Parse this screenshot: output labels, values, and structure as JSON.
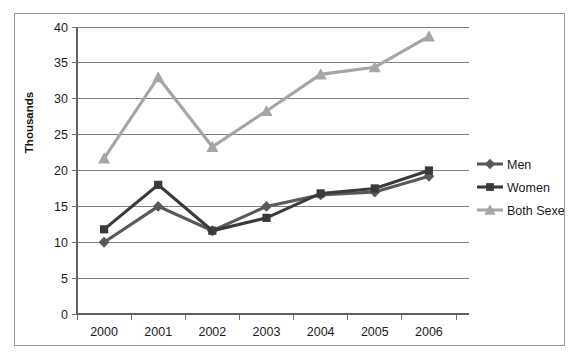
{
  "chart_data": {
    "type": "line",
    "title": "",
    "xlabel": "",
    "ylabel": "Thousands",
    "categories": [
      "2000",
      "2001",
      "2002",
      "2003",
      "2004",
      "2005",
      "2006"
    ],
    "x": [
      2000,
      2001,
      2002,
      2003,
      2004,
      2005,
      2006
    ],
    "ylim": [
      0,
      40
    ],
    "yticks": [
      0,
      5,
      10,
      15,
      20,
      25,
      30,
      35,
      40
    ],
    "ytick_labels": [
      "0",
      "5",
      "10",
      "15",
      "20",
      "25",
      "30",
      "35",
      "40"
    ],
    "grid": true,
    "legend_position": "right",
    "series": [
      {
        "name": "Men",
        "color": "#595959",
        "marker": "diamond",
        "values": [
          10.0,
          15.0,
          11.6,
          15.0,
          16.6,
          17.0,
          19.2
        ]
      },
      {
        "name": "Women",
        "color": "#3a3a3a",
        "marker": "square",
        "values": [
          11.8,
          18.0,
          11.6,
          13.4,
          16.8,
          17.5,
          20.0
        ]
      },
      {
        "name": "Both Sexes",
        "color": "#a6a6a6",
        "marker": "triangle",
        "values": [
          21.7,
          33.0,
          23.3,
          28.3,
          33.4,
          34.4,
          38.7
        ]
      }
    ]
  },
  "axis": {
    "y_title": "Thousands"
  },
  "legend": {
    "items": [
      {
        "label": "Men"
      },
      {
        "label": "Women"
      },
      {
        "label": "Both Sexes"
      }
    ]
  },
  "colors": {
    "men": "#595959",
    "women": "#3a3a3a",
    "both_sexes": "#a6a6a6",
    "gridline": "#808080",
    "frame": "#9a9a9a",
    "text": "#1a1a1a"
  }
}
